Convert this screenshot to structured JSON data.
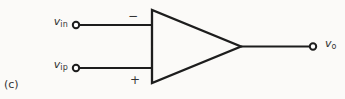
{
  "figure": {
    "part_label": "(c)",
    "component": "operational-amplifier",
    "inputs": [
      {
        "id": "inverting",
        "label_base": "v",
        "label_sub": "in",
        "sign": "−"
      },
      {
        "id": "noninverting",
        "label_base": "v",
        "label_sub": "ip",
        "sign": "+"
      }
    ],
    "output": {
      "label_base": "v",
      "label_sub": "o"
    }
  },
  "colors": {
    "line": "#1d1d1d",
    "text": "#333333",
    "background": "#fbfaf8"
  }
}
